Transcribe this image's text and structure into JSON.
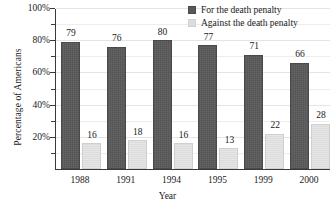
{
  "chart_data": {
    "type": "bar",
    "title": "",
    "xlabel": "Year",
    "ylabel": "Percentage of Americans",
    "categories": [
      "1988",
      "1991",
      "1994",
      "1995",
      "1999",
      "2000"
    ],
    "series": [
      {
        "name": "For the death penalty",
        "color": "#585858",
        "values": [
          79,
          76,
          80,
          77,
          71,
          66
        ]
      },
      {
        "name": "Against the death penalty",
        "color": "#dcdcdc",
        "values": [
          16,
          18,
          16,
          13,
          22,
          28
        ]
      }
    ],
    "ylim": [
      0,
      100
    ],
    "ytick_labels": [
      "20%",
      "40%",
      "60%",
      "80%",
      "100%"
    ],
    "ytick_values": [
      20,
      40,
      60,
      80,
      100
    ],
    "yminor_step": 10,
    "grid": true,
    "legend_position": "top-right",
    "value_labels": true
  },
  "legend": {
    "items": [
      {
        "label": "For the death penalty",
        "swatch": "dark"
      },
      {
        "label": "Against the death penalty",
        "swatch": "light"
      }
    ]
  },
  "axes": {
    "y": {
      "title": "Percentage of Americans",
      "ticks": [
        "100%",
        "80%",
        "60%",
        "40%",
        "20%"
      ]
    },
    "x": {
      "title": "Year",
      "ticks": [
        "1988",
        "1991",
        "1994",
        "1995",
        "1999",
        "2000"
      ]
    }
  }
}
